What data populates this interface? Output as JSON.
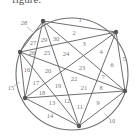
{
  "caption": "figure:",
  "diagram": {
    "type": "circle-chords",
    "points": 6,
    "circle": {
      "cx": 72,
      "cy": 74,
      "r": 56
    },
    "vertices": [
      {
        "id": "A",
        "x": 43,
        "y": 21
      },
      {
        "id": "B",
        "x": 116,
        "y": 32
      },
      {
        "id": "D",
        "x": 125,
        "y": 91
      },
      {
        "id": "F",
        "x": 79,
        "y": 126
      },
      {
        "id": "E",
        "x": 25,
        "y": 98
      },
      {
        "id": "C",
        "x": 20,
        "y": 52
      }
    ],
    "region_labels": [
      {
        "n": "1",
        "x": 80,
        "y": 21
      },
      {
        "n": "2",
        "x": 74,
        "y": 34
      },
      {
        "n": "3",
        "x": 84,
        "y": 45
      },
      {
        "n": "4",
        "x": 101,
        "y": 53
      },
      {
        "n": "5",
        "x": 124,
        "y": 60
      },
      {
        "n": "6",
        "x": 112,
        "y": 66
      },
      {
        "n": "7",
        "x": 103,
        "y": 78
      },
      {
        "n": "8",
        "x": 101,
        "y": 89
      },
      {
        "n": "9",
        "x": 98,
        "y": 104
      },
      {
        "n": "10",
        "x": 112,
        "y": 122
      },
      {
        "n": "11",
        "x": 80,
        "y": 108
      },
      {
        "n": "12",
        "x": 67,
        "y": 102
      },
      {
        "n": "13",
        "x": 52,
        "y": 104
      },
      {
        "n": "14",
        "x": 50,
        "y": 117
      },
      {
        "n": "15",
        "x": 11,
        "y": 89
      },
      {
        "n": "16",
        "x": 27,
        "y": 71
      },
      {
        "n": "17",
        "x": 36,
        "y": 84
      },
      {
        "n": "18",
        "x": 42,
        "y": 94
      },
      {
        "n": "19",
        "x": 58,
        "y": 87
      },
      {
        "n": "20",
        "x": 48,
        "y": 72
      },
      {
        "n": "21",
        "x": 84,
        "y": 89
      },
      {
        "n": "22",
        "x": 74,
        "y": 80
      },
      {
        "n": "23",
        "x": 82,
        "y": 69
      },
      {
        "n": "24",
        "x": 66,
        "y": 55
      },
      {
        "n": "25",
        "x": 47,
        "y": 54
      },
      {
        "n": "26",
        "x": 32,
        "y": 54
      },
      {
        "n": "27",
        "x": 33,
        "y": 44
      },
      {
        "n": "28",
        "x": 24,
        "y": 24
      },
      {
        "n": "29",
        "x": 44,
        "y": 41
      },
      {
        "n": "30",
        "x": 56,
        "y": 40
      }
    ],
    "colors": {
      "lines": "#6f6f6f",
      "vertex": "#555555",
      "labels": "#777777"
    }
  }
}
